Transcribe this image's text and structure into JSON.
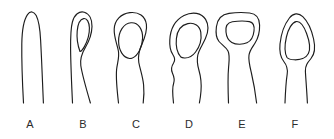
{
  "figure": {
    "type": "line-drawing-plate",
    "background_color": "#ffffff",
    "stroke_color": "#1d1d1d",
    "label_color": "#2b2b2b",
    "panel_count": 6,
    "caption": ""
  },
  "panels": [
    {
      "label": "A",
      "label_x": 30,
      "label_y": 128,
      "description": "narrow tapering tube with closed rounded apex, no aperture",
      "aperture_shape": "none",
      "outline_path": "M23.5 103 C22.4 83 21.6 62 21.8 44 C22.0 31 23.4 20.5 27.5 14.6 C30.3 10.6 33.9 11.2 36.2 15.6 C38.7 20.4 40.0 29.0 40.6 40.0 C41.6 58.0 42.4 80.0 43.4 103",
      "aperture_path": ""
    },
    {
      "label": "B",
      "label_x": 83,
      "label_y": 128,
      "description": "tapering tube with narrow elongate teardrop aperture at apex",
      "aperture_shape": "teardrop",
      "outline_path": "M72.5 103 C71.6 84 70.8 64 70.6 50 C70.5 38 70.6 28.5 72.4 22.0 C74.4 14.6 79.2 10.8 84.3 12.2 C89.4 13.6 92.2 19.4 92.0 26.6 C91.8 33.6 89.4 40.6 85.6 47.0 C82.0 53.0 79.8 58.5 80.8 65.5 C82.0 74.0 86.0 88.0 90.4 103",
      "aperture_path": "M80.0 51.5 C77.6 45.0 76.6 37.5 77.2 31.0 C77.8 24.5 80.3 19.2 83.6 18.6 C87.0 18.0 89.2 22.2 89.4 27.8 C89.6 34.2 87.4 41.2 84.4 46.6 C82.8 49.5 81.2 51.2 80.0 51.5 Z"
    },
    {
      "label": "C",
      "label_x": 136,
      "label_y": 128,
      "description": "bulbous head with large rounded oval aperture, constricted stem below",
      "aperture_shape": "oval",
      "outline_path": "M118.5 103 C117.0 90 115.8 78 116.6 69.5 C117.3 62.5 119.6 57.5 118.4 51.0 C117.0 43.5 113.8 37.0 114.2 29.0 C114.6 20.2 121.0 13.6 129.8 12.6 C138.8 11.6 145.2 16.2 146.4 24.4 C147.4 31.4 144.6 38.2 141.8 44.6 C139.0 51.0 137.6 56.0 138.8 62.5 C140.0 69.0 142.8 76.5 143.6 85.0 C144.3 92.0 143.8 98.0 143.2 103",
      "aperture_path": "M129.6 58.5 C123.2 57.8 118.8 50.6 118.6 41.6 C118.4 31.6 123.6 23.4 131.0 22.8 C138.2 22.2 142.8 29.0 142.6 38.0 C142.4 47.0 138.0 55.6 132.4 58.0 C131.4 58.4 130.5 58.6 129.6 58.5 Z"
    },
    {
      "label": "D",
      "label_x": 189,
      "label_y": 128,
      "description": "broad head with rounded-square aperture, wavy stem on left side",
      "aperture_shape": "rounded-square",
      "outline_path": "M173.5 103 C172.6 95 172.0 88 173.6 83.5 C175.0 79.5 174.0 76.5 172.4 73.0 C170.8 69.5 171.6 66.0 173.6 63.0 C175.4 60.3 174.8 57.5 172.8 54.5 C170.4 51.0 169.4 46.5 169.8 40.0 C170.4 29.0 175.6 20.0 184.0 15.6 C192.6 11.1 201.6 12.8 205.6 19.4 C209.0 25.0 208.4 32.0 205.4 38.6 C202.6 44.8 199.0 49.6 197.8 55.0 C196.6 60.5 197.4 65.0 199.0 70.5 C200.6 76.0 201.6 83.0 201.0 91.0 C200.6 96.0 200.0 100.0 199.4 103",
      "aperture_path": "M180.8 57.0 C177.4 53.0 175.6 46.0 176.4 38.5 C177.2 30.6 181.4 25.0 187.8 23.6 C194.4 22.2 199.8 25.8 200.8 32.4 C201.8 39.2 199.4 47.0 195.6 52.0 C192.6 56.0 188.4 58.2 184.4 58.0 C182.8 57.9 181.6 57.6 180.8 57.0 Z"
    },
    {
      "label": "E",
      "label_x": 242,
      "label_y": 128,
      "description": "wide flat-topped head with broad trapezoidal flat-topped aperture",
      "aperture_shape": "trapezoid-flat-top",
      "outline_path": "M228.5 103 C228.0 90 227.8 76 228.6 67.0 C229.2 60.0 230.0 55.0 228.0 51.0 C226.0 47.0 222.0 45.0 219.0 41.5 C216.2 38.2 215.6 33.0 216.4 26.8 C217.4 19.2 221.6 14.4 229.0 13.4 C235.4 12.5 243.0 12.3 249.6 13.0 C256.2 13.7 259.4 17.8 259.6 25.0 C259.8 32.0 258.0 38.2 255.2 42.8 C252.6 47.0 249.8 50.0 249.0 55.0 C248.2 60.0 249.6 65.5 251.4 73.0 C253.4 81.5 255.4 93.0 256.6 103",
      "aperture_path": "M226.0 32.0 C225.4 26.6 227.6 22.6 232.4 21.8 C238.6 20.8 245.0 20.8 249.4 21.6 C253.6 22.4 254.6 26.0 254.0 31.0 C253.4 36.4 251.0 41.0 247.0 42.8 C242.8 44.7 236.0 44.8 231.8 42.4 C228.2 40.4 226.4 36.4 226.0 32.0 Z"
    },
    {
      "label": "F",
      "label_x": 295,
      "label_y": 128,
      "description": "narrow stem widening to a rhombic head with triangular aperture, apex pointed",
      "aperture_shape": "triangle",
      "outline_path": "M285.0 103 C285.4 92 286.0 82 287.2 74.0 C288.0 68.5 286.6 65.0 283.8 61.5 C280.6 57.5 279.2 52.0 280.0 44.0 C280.9 35.0 284.0 25.0 289.4 18.0 C293.2 13.0 298.4 12.4 302.8 16.6 C307.4 21.0 311.6 30.0 313.6 39.0 C315.4 47.0 314.8 54.0 311.0 58.5 C307.6 62.5 305.2 65.5 305.4 71.0 C305.6 77.0 306.6 87.0 307.4 103",
      "aperture_path": "M287.0 57.5 C284.6 53.0 284.6 45.0 286.4 37.0 C288.2 29.0 292.0 22.4 296.0 21.6 C299.8 20.8 303.8 26.0 306.6 33.5 C309.4 41.0 310.6 49.0 308.4 53.5 C306.2 58.0 300.0 60.0 294.4 59.8 C290.8 59.7 288.2 59.0 287.0 57.5 Z"
    }
  ]
}
